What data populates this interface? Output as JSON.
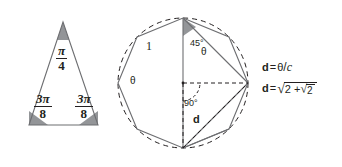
{
  "figure": {
    "background_color": "#ffffff",
    "line_color": "#6d6e71",
    "text_color": "#231f20",
    "wedge_fill": "#939598",
    "triangle": {
      "apex_angle": {
        "numerator": "π",
        "denominator": "4"
      },
      "left_base_angle": {
        "numerator": "3π",
        "denominator": "8"
      },
      "right_base_angle": {
        "numerator": "3π",
        "denominator": "8"
      }
    },
    "polygon": {
      "side_label": "1",
      "apex_angle_label": "45°",
      "center_angle_label": "90°",
      "chord_label_left": "θ",
      "chord_label_right": "θ",
      "diagonal_label": "d"
    },
    "equations": {
      "first": {
        "lhs": "d",
        "equals": "=",
        "numerator": "θ",
        "slash": "/",
        "denominator": "c"
      },
      "second": {
        "lhs": "d",
        "equals": "=",
        "radicand_outer_prefix": "2 +",
        "radicand_inner": "2",
        "radical_sign": "√"
      }
    }
  }
}
